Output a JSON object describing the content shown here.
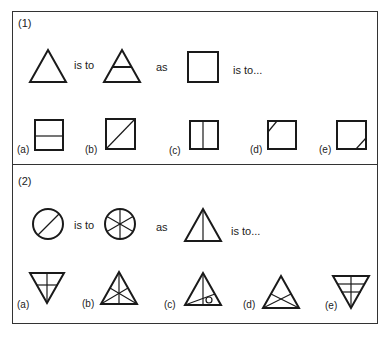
{
  "questions": [
    {
      "number": "(1)",
      "stem": {
        "first_shape": "triangle",
        "connector1": "is to",
        "second_shape": "triangle-with-horizontal-line",
        "connector2": "as",
        "third_shape": "square",
        "connector3": "is to..."
      },
      "options": [
        {
          "label": "(a)",
          "shape": "square-with-horizontal-line"
        },
        {
          "label": "(b)",
          "shape": "square-with-diagonal"
        },
        {
          "label": "(c)",
          "shape": "square-with-vertical-line"
        },
        {
          "label": "(d)",
          "shape": "square-with-top-left-corner-cut"
        },
        {
          "label": "(e)",
          "shape": "square-with-bottom-right-corner-cut"
        }
      ]
    },
    {
      "number": "(2)",
      "stem": {
        "first_shape": "circle-with-diagonal",
        "connector1": "is to",
        "second_shape": "circle-with-six-spokes",
        "connector2": "as",
        "third_shape": "triangle-with-vertical-line",
        "connector3": "is to..."
      },
      "options": [
        {
          "label": "(a)",
          "shape": "inverted-triangle-with-cross"
        },
        {
          "label": "(b)",
          "shape": "triangle-with-three-medians"
        },
        {
          "label": "(c)",
          "shape": "triangle-with-line-and-small-circle"
        },
        {
          "label": "(d)",
          "shape": "triangle-with-crossing-lines"
        },
        {
          "label": "(e)",
          "shape": "inverted-triangle-with-grid"
        }
      ]
    }
  ]
}
